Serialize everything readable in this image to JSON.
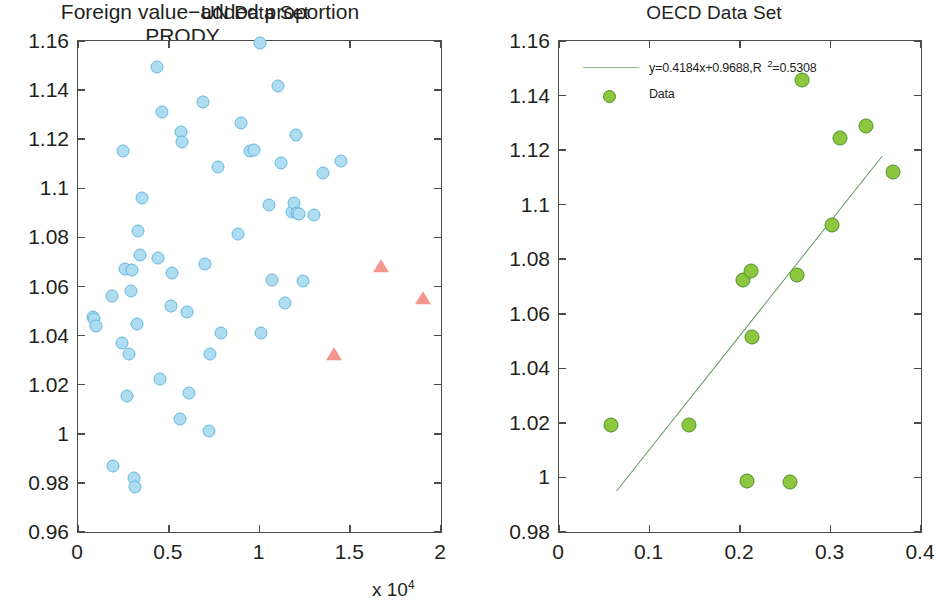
{
  "figure": {
    "background": "#ffffff",
    "panels": [
      "UN Data Set",
      "OECD Data Set"
    ]
  },
  "colors": {
    "un_marker_fill": "#aedcf0",
    "un_marker_edge": "#63b8e0",
    "un_outlier_fill": "#f4968e",
    "oecd_marker_fill": "#8dc63f",
    "oecd_marker_edge": "#4f8f2a",
    "fit_line": "#5d9a5d",
    "axis": "#4c4c4c",
    "text": "#231f20"
  },
  "un_panel": {
    "title": "UN Data Set",
    "xlabel": "PRODY",
    "ylabel": "η",
    "x_exponent_prefix": "x 10",
    "x_exponent_power": "4",
    "x_ticklabels": [
      "0",
      "0.5",
      "1",
      "1.5",
      "2"
    ],
    "y_ticklabels": [
      "0.96",
      "0.98",
      "1",
      "1.02",
      "1.04",
      "1.06",
      "1.08",
      "1.1",
      "1.12",
      "1.14",
      "1.16"
    ]
  },
  "oecd_panel": {
    "title": "OECD Data Set",
    "xlabel": "Foreign value−added proportion",
    "x_ticklabels": [
      "0",
      "0.1",
      "0.2",
      "0.3",
      "0.4"
    ],
    "y_ticklabels": [
      "0.98",
      "1",
      "1.02",
      "1.04",
      "1.06",
      "1.08",
      "1.1",
      "1.12",
      "1.14",
      "1.16"
    ],
    "legend": {
      "fit_label_main": "y=0.4184x+0.9688,R",
      "fit_label_sup": "2",
      "fit_label_tail": "=0.5308",
      "data_label": "Data"
    }
  },
  "chart_data": [
    {
      "type": "scatter",
      "title": "UN Data Set",
      "xlabel": "PRODY",
      "ylabel": "η",
      "x_scale_exponent": 4,
      "xlim": [
        0,
        20000
      ],
      "ylim": [
        0.96,
        1.16
      ],
      "xticks": [
        0,
        5000,
        10000,
        15000,
        20000
      ],
      "yticks": [
        0.96,
        0.98,
        1.0,
        1.02,
        1.04,
        1.06,
        1.08,
        1.1,
        1.12,
        1.14,
        1.16
      ],
      "grid": false,
      "legend": null,
      "series": [
        {
          "name": "UN countries",
          "marker": "circle",
          "color": "#aedcf0",
          "points": [
            [
              800,
              1.0475
            ],
            [
              900,
              1.0468
            ],
            [
              1000,
              1.0438
            ],
            [
              1900,
              1.056
            ],
            [
              1950,
              0.9868
            ],
            [
              2450,
              1.0368
            ],
            [
              2500,
              1.115
            ],
            [
              2600,
              1.067
            ],
            [
              2700,
              1.0152
            ],
            [
              2800,
              1.0325
            ],
            [
              2900,
              1.0583
            ],
            [
              3000,
              1.0668
            ],
            [
              3100,
              0.9818
            ],
            [
              3120,
              0.9783
            ],
            [
              3250,
              1.0446
            ],
            [
              3300,
              1.0825
            ],
            [
              3400,
              1.073
            ],
            [
              3500,
              1.096
            ],
            [
              4350,
              1.1493
            ],
            [
              4400,
              1.0718
            ],
            [
              4500,
              1.0225
            ],
            [
              4650,
              1.1312
            ],
            [
              5100,
              1.052
            ],
            [
              5200,
              1.0655
            ],
            [
              5600,
              1.006
            ],
            [
              5700,
              1.1231
            ],
            [
              5750,
              1.119
            ],
            [
              6000,
              1.0498
            ],
            [
              6100,
              1.0166
            ],
            [
              6900,
              1.135
            ],
            [
              7000,
              1.069
            ],
            [
              7200,
              1.0013
            ],
            [
              7300,
              1.0325
            ],
            [
              7700,
              1.1088
            ],
            [
              7900,
              1.041
            ],
            [
              8800,
              1.0812
            ],
            [
              9000,
              1.1265
            ],
            [
              9500,
              1.115
            ],
            [
              9700,
              1.1158
            ],
            [
              10000,
              1.159
            ],
            [
              10100,
              1.0412
            ],
            [
              10500,
              1.0932
            ],
            [
              10700,
              1.0625
            ],
            [
              11000,
              1.1418
            ],
            [
              11200,
              1.1103
            ],
            [
              11400,
              1.0532
            ],
            [
              11800,
              1.0905
            ],
            [
              11900,
              1.094
            ],
            [
              12000,
              1.1218
            ],
            [
              12050,
              1.09
            ],
            [
              12200,
              1.0895
            ],
            [
              12400,
              1.0622
            ],
            [
              13000,
              1.089
            ],
            [
              13500,
              1.1062
            ],
            [
              14500,
              1.1112
            ]
          ]
        },
        {
          "name": "Outliers",
          "marker": "triangle",
          "color": "#f4968e",
          "points": [
            [
              14100,
              1.0322
            ],
            [
              16700,
              1.068
            ],
            [
              19000,
              1.055
            ]
          ]
        }
      ]
    },
    {
      "type": "scatter",
      "title": "OECD Data Set",
      "xlabel": "Foreign value−added proportion",
      "ylabel": "",
      "xlim": [
        0,
        0.4
      ],
      "ylim": [
        0.98,
        1.16
      ],
      "xticks": [
        0,
        0.1,
        0.2,
        0.3,
        0.4
      ],
      "yticks": [
        0.98,
        1.0,
        1.02,
        1.04,
        1.06,
        1.08,
        1.1,
        1.12,
        1.14,
        1.16
      ],
      "grid": false,
      "legend_position": "upper-left",
      "series": [
        {
          "name": "Data",
          "marker": "circle",
          "color": "#8dc63f",
          "points": [
            [
              0.057,
              1.0192
            ],
            [
              0.144,
              1.0192
            ],
            [
              0.203,
              1.0722
            ],
            [
              0.208,
              0.9988
            ],
            [
              0.212,
              1.0755
            ],
            [
              0.213,
              1.0515
            ],
            [
              0.255,
              0.9982
            ],
            [
              0.263,
              1.0742
            ],
            [
              0.268,
              1.1458
            ],
            [
              0.302,
              1.0925
            ],
            [
              0.311,
              1.1245
            ],
            [
              0.339,
              1.129
            ],
            [
              0.369,
              1.112
            ]
          ]
        }
      ],
      "fit": {
        "name": "y=0.4184x+0.9688,R^2=0.5308",
        "slope": 0.4184,
        "intercept": 0.9688,
        "r_squared": 0.5308,
        "color": "#5d9a5d",
        "x_start": 0.063,
        "x_end": 0.357
      }
    }
  ]
}
